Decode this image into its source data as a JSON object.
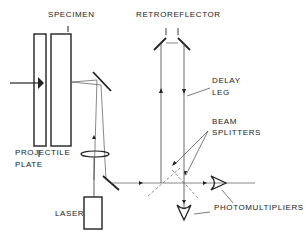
{
  "diagram": {
    "labels": {
      "specimen": "SPECIMEN",
      "retroreflector": "RETROREFLECTOR",
      "delay_leg_1": "DELAY",
      "delay_leg_2": "LEG",
      "beam_splitters_1": "BEAM",
      "beam_splitters_2": "SPLITTERS",
      "projectile_plate_1": "PROJECTILE",
      "projectile_plate_2": "PLATE",
      "laser": "LASER",
      "photomultipliers": "PHOTOMULTIPLIERS"
    },
    "colors": {
      "line": "#222222",
      "background": "#ffffff"
    }
  }
}
